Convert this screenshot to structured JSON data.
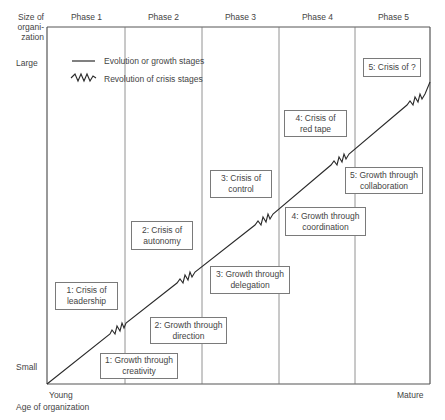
{
  "diagram": {
    "y_axis": {
      "title_lines": [
        "Size of",
        "organi-",
        "zation"
      ],
      "top_label": "Large",
      "bottom_label": "Small"
    },
    "x_axis": {
      "left_label": "Young",
      "right_label": "Mature",
      "title": "Age of organization"
    },
    "phases": [
      {
        "label": "Phase 1"
      },
      {
        "label": "Phase 2"
      },
      {
        "label": "Phase 3"
      },
      {
        "label": "Phase 4"
      },
      {
        "label": "Phase 5"
      }
    ],
    "legend": {
      "evolution": "Evolution or growth stages",
      "revolution": "Revolution of crisis stages"
    },
    "growth_stages": [
      {
        "line1": "1: Growth through",
        "line2": "creativity"
      },
      {
        "line1": "2: Growth through",
        "line2": "direction"
      },
      {
        "line1": "3: Growth through",
        "line2": "delegation"
      },
      {
        "line1": "4: Growth through",
        "line2": "coordination"
      },
      {
        "line1": "5: Growth through",
        "line2": "collaboration"
      }
    ],
    "crisis_stages": [
      {
        "line1": "1: Crisis of",
        "line2": "leadership"
      },
      {
        "line1": "2: Crisis of",
        "line2": "autonomy"
      },
      {
        "line1": "3: Crisis of",
        "line2": "control"
      },
      {
        "line1": "4: Crisis of",
        "line2": "red tape"
      },
      {
        "line1": "5: Crisis of ?",
        "line2": ""
      }
    ],
    "colors": {
      "frame": "#555555",
      "line": "#2a2a2a",
      "box_border": "#7a7a7a",
      "text": "#444444"
    }
  }
}
